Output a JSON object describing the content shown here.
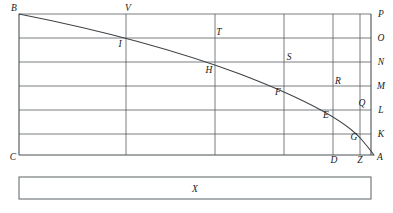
{
  "figure": {
    "canvas": {
      "width": 393,
      "height": 213
    },
    "colors": {
      "background": "#ffffff",
      "grid": "#555b5e",
      "frame": "#4a5053",
      "curve": "#3d4245",
      "box": "#6b7073",
      "label": "#1a1a1a"
    }
  },
  "grid": {
    "left": 19,
    "right": 371,
    "top": 14,
    "bottom": 155,
    "horizontal_y": [
      14,
      38,
      62,
      86,
      110,
      134,
      155
    ],
    "vertical_x": [
      19,
      126,
      215,
      284,
      333,
      360,
      371
    ]
  },
  "curve": {
    "description": "Descending concave curve from B at upper-left to A at lower-right",
    "start": {
      "x": 19,
      "y": 14
    },
    "end": {
      "x": 374,
      "y": 155
    },
    "path": "M 19 14 C 90 28, 170 48, 240 74 C 300 97, 345 120, 362 140 C 368 147, 371 151, 374 155"
  },
  "labels": [
    {
      "name": "B",
      "text": "B",
      "x": 14,
      "y": 11,
      "anchor": "middle"
    },
    {
      "name": "V",
      "text": "V",
      "x": 128,
      "y": 11,
      "anchor": "middle"
    },
    {
      "name": "P",
      "text": "P",
      "x": 381,
      "y": 17,
      "anchor": "middle"
    },
    {
      "name": "T",
      "text": "T",
      "x": 219,
      "y": 35,
      "anchor": "middle"
    },
    {
      "name": "I",
      "text": "I",
      "x": 120,
      "y": 47,
      "anchor": "middle"
    },
    {
      "name": "O",
      "text": "O",
      "x": 381,
      "y": 41,
      "anchor": "middle"
    },
    {
      "name": "S",
      "text": "S",
      "x": 289,
      "y": 60,
      "anchor": "middle"
    },
    {
      "name": "N",
      "text": "N",
      "x": 381,
      "y": 65,
      "anchor": "middle"
    },
    {
      "name": "H",
      "text": "H",
      "x": 209,
      "y": 73,
      "anchor": "middle"
    },
    {
      "name": "R",
      "text": "R",
      "x": 338,
      "y": 84,
      "anchor": "middle"
    },
    {
      "name": "M",
      "text": "M",
      "x": 381,
      "y": 89,
      "anchor": "middle"
    },
    {
      "name": "F",
      "text": "F",
      "x": 278,
      "y": 95,
      "anchor": "middle"
    },
    {
      "name": "Q",
      "text": "Q",
      "x": 362,
      "y": 106,
      "anchor": "middle"
    },
    {
      "name": "L",
      "text": "L",
      "x": 381,
      "y": 113,
      "anchor": "middle"
    },
    {
      "name": "E",
      "text": "E",
      "x": 326,
      "y": 118,
      "anchor": "middle"
    },
    {
      "name": "G",
      "text": "G",
      "x": 354,
      "y": 140,
      "anchor": "middle"
    },
    {
      "name": "K",
      "text": "K",
      "x": 381,
      "y": 137,
      "anchor": "middle"
    },
    {
      "name": "C",
      "text": "C",
      "x": 13,
      "y": 160,
      "anchor": "middle"
    },
    {
      "name": "D",
      "text": "D",
      "x": 334,
      "y": 163,
      "anchor": "middle"
    },
    {
      "name": "Z",
      "text": "Z",
      "x": 360,
      "y": 163,
      "anchor": "middle"
    },
    {
      "name": "A",
      "text": "A",
      "x": 380,
      "y": 160,
      "anchor": "middle"
    }
  ],
  "lower_bar": {
    "label": "X",
    "x": 19,
    "y": 177,
    "width": 352,
    "height": 22,
    "label_x": 195,
    "label_y": 192
  }
}
